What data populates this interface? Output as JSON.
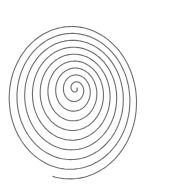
{
  "image": {
    "subject": "hand-drawn spiral",
    "stroke_color": "#6e6e6e",
    "background": "#ffffff"
  }
}
